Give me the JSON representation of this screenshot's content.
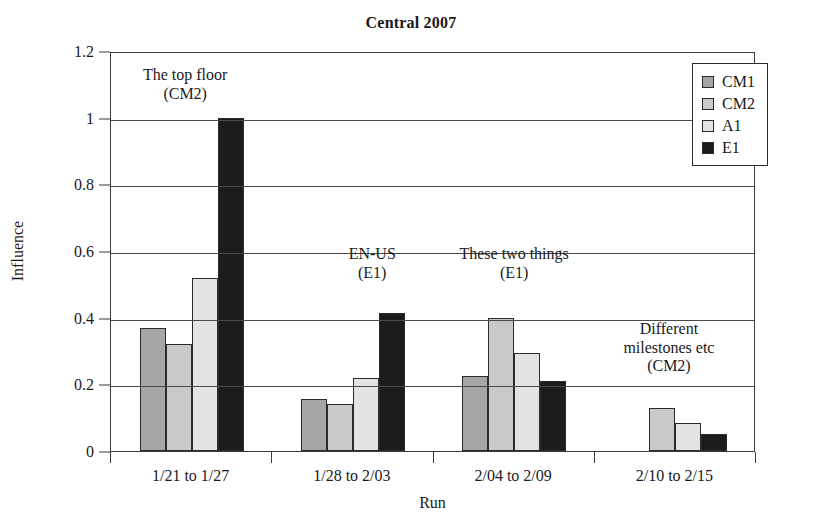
{
  "chart_data": {
    "type": "bar",
    "title": "Central 2007",
    "xlabel": "Run",
    "ylabel": "Influence",
    "ylim": [
      0,
      1.2
    ],
    "yticks": [
      "0",
      "0.2",
      "0.4",
      "0.6",
      "0.8",
      "1",
      "1.2"
    ],
    "ytick_values": [
      0,
      0.2,
      0.4,
      0.6,
      0.8,
      1,
      1.2
    ],
    "grid": true,
    "legend_position": "top-right",
    "categories": [
      "1/21 to 1/27",
      "1/28 to 2/03",
      "2/04 to 2/09",
      "2/10 to 2/15"
    ],
    "series": [
      {
        "name": "CM1",
        "color": "#a6a6a6",
        "values": [
          0.37,
          0.155,
          0.225,
          0
        ]
      },
      {
        "name": "CM2",
        "color": "#c9c9c9",
        "values": [
          0.32,
          0.14,
          0.4,
          0.13
        ]
      },
      {
        "name": "A1",
        "color": "#e3e3e3",
        "values": [
          0.52,
          0.22,
          0.295,
          0.085
        ]
      },
      {
        "name": "E1",
        "color": "#1c1c1c",
        "values": [
          1.0,
          0.415,
          0.21,
          0.05
        ]
      }
    ],
    "annotations": [
      {
        "lines": [
          "The top floor",
          "(CM2)"
        ],
        "x_frac": 0.115,
        "y_value": 1.16
      },
      {
        "lines": [
          "EN-US",
          "(E1)"
        ],
        "x_frac": 0.405,
        "y_value": 0.625
      },
      {
        "lines": [
          "These two things",
          "(E1)"
        ],
        "x_frac": 0.625,
        "y_value": 0.625
      },
      {
        "lines": [
          "Different",
          "milestones etc",
          "(CM2)"
        ],
        "x_frac": 0.865,
        "y_value": 0.4
      }
    ]
  }
}
